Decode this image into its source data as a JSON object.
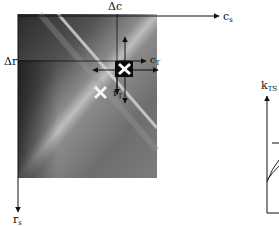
{
  "figure": {
    "left_panel": {
      "description": "grayscale image patch with diagonal bright ridge",
      "axis_labels": {
        "column_axis": {
          "base": "c",
          "sub": "s"
        },
        "row_axis": {
          "base": "r",
          "sub": "s"
        },
        "delta_c": "Δc",
        "delta_r": "Δr",
        "template_column": {
          "base": "c",
          "sub": "T"
        },
        "template_row": {
          "base": "r",
          "sub": "T"
        }
      },
      "markers": [
        {
          "name": "template-center-marker",
          "style": "white X on black square"
        },
        {
          "name": "candidate-marker",
          "style": "white X"
        }
      ]
    },
    "right_panel": {
      "y_label": {
        "base": "k",
        "sub": "TS"
      },
      "partial": true
    }
  }
}
